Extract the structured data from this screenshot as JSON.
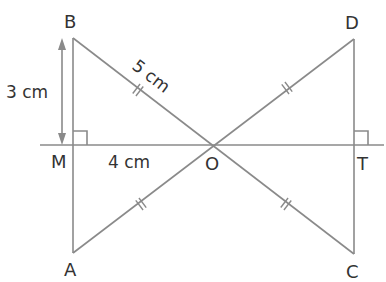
{
  "diagram": {
    "type": "geometry-figure",
    "points": {
      "B": {
        "label": "B",
        "x": 73,
        "y": 38
      },
      "M": {
        "label": "M",
        "x": 73,
        "y": 145
      },
      "A": {
        "label": "A",
        "x": 73,
        "y": 253
      },
      "O": {
        "label": "O",
        "x": 212,
        "y": 145
      },
      "D": {
        "label": "D",
        "x": 354,
        "y": 39
      },
      "T": {
        "label": "T",
        "x": 354,
        "y": 145
      },
      "C": {
        "label": "C",
        "x": 354,
        "y": 254
      }
    },
    "measurements": {
      "BM": "3 cm",
      "BO": "5 cm",
      "MO": "4 cm"
    },
    "markings": {
      "equal_segments": [
        "BO",
        "OD",
        "AO",
        "OC"
      ],
      "right_angles": [
        "BMO",
        "DTO"
      ],
      "double_arrow": "BM"
    },
    "colors": {
      "line": "#8a8a8a",
      "text": "#333333",
      "background": "#ffffff"
    }
  }
}
